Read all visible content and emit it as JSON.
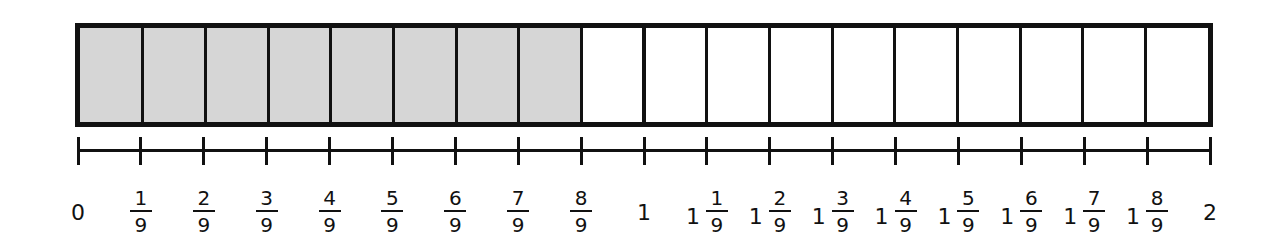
{
  "diagram": {
    "type": "fraction-bar-and-number-line",
    "denominator": 9,
    "total_segments": 18,
    "shaded_segments": 8,
    "shaded_value": "8/9",
    "colors": {
      "shade": "#d6d6d6",
      "line": "#111111",
      "background": "#ffffff"
    }
  },
  "number_line": {
    "start": "0",
    "end": "2",
    "labels": [
      {
        "whole": "0",
        "num": "",
        "den": ""
      },
      {
        "whole": "",
        "num": "1",
        "den": "9"
      },
      {
        "whole": "",
        "num": "2",
        "den": "9"
      },
      {
        "whole": "",
        "num": "3",
        "den": "9"
      },
      {
        "whole": "",
        "num": "4",
        "den": "9"
      },
      {
        "whole": "",
        "num": "5",
        "den": "9"
      },
      {
        "whole": "",
        "num": "6",
        "den": "9"
      },
      {
        "whole": "",
        "num": "7",
        "den": "9"
      },
      {
        "whole": "",
        "num": "8",
        "den": "9"
      },
      {
        "whole": "1",
        "num": "",
        "den": ""
      },
      {
        "whole": "1",
        "num": "1",
        "den": "9"
      },
      {
        "whole": "1",
        "num": "2",
        "den": "9"
      },
      {
        "whole": "1",
        "num": "3",
        "den": "9"
      },
      {
        "whole": "1",
        "num": "4",
        "den": "9"
      },
      {
        "whole": "1",
        "num": "5",
        "den": "9"
      },
      {
        "whole": "1",
        "num": "6",
        "den": "9"
      },
      {
        "whole": "1",
        "num": "7",
        "den": "9"
      },
      {
        "whole": "1",
        "num": "8",
        "den": "9"
      },
      {
        "whole": "2",
        "num": "",
        "den": ""
      }
    ]
  }
}
